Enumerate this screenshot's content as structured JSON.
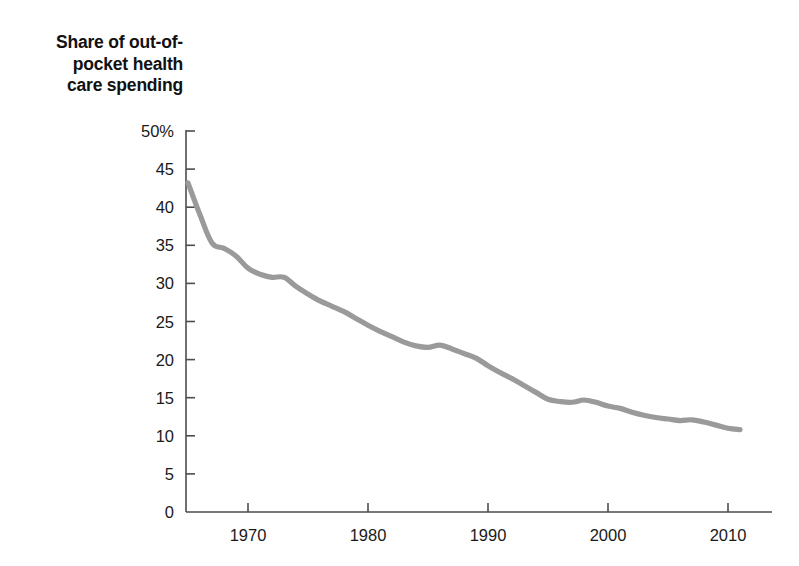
{
  "chart_data": {
    "type": "line",
    "title_lines": [
      "Share of out-of-",
      "pocket health",
      "care spending"
    ],
    "xlabel": "",
    "ylabel": "Share of out-of-pocket health care spending",
    "xlim": [
      1964.8,
      2012.5
    ],
    "ylim": [
      0,
      50
    ],
    "grid": false,
    "legend": "none",
    "line_color": "#9a9a9a",
    "axis_color": "#4d4d4d",
    "background_color": "#ffffff",
    "y_ticks": [
      0,
      5,
      10,
      15,
      20,
      25,
      30,
      35,
      40,
      45,
      50
    ],
    "y_tick_labels": [
      "0",
      "5",
      "10",
      "15",
      "20",
      "25",
      "30",
      "35",
      "40",
      "45",
      "50%"
    ],
    "x_ticks": [
      1970,
      1980,
      1990,
      2000,
      2010
    ],
    "x_tick_labels": [
      "1970",
      "1980",
      "1990",
      "2000",
      "2010"
    ],
    "series": [
      {
        "name": "Share of out-of-pocket health care spending",
        "units": "percent",
        "x": [
          1965,
          1966,
          1967,
          1968,
          1969,
          1970,
          1971,
          1972,
          1973,
          1974,
          1975,
          1976,
          1977,
          1978,
          1979,
          1980,
          1981,
          1982,
          1983,
          1984,
          1985,
          1986,
          1987,
          1988,
          1989,
          1990,
          1991,
          1992,
          1993,
          1994,
          1995,
          1996,
          1997,
          1998,
          1999,
          2000,
          2001,
          2002,
          2003,
          2004,
          2005,
          2006,
          2007,
          2008,
          2009,
          2010,
          2011
        ],
        "values": [
          43.2,
          39.0,
          35.3,
          34.6,
          33.6,
          32.0,
          31.2,
          30.8,
          30.8,
          29.6,
          28.6,
          27.7,
          27.0,
          26.3,
          25.4,
          24.5,
          23.7,
          23.0,
          22.3,
          21.8,
          21.6,
          21.9,
          21.4,
          20.8,
          20.2,
          19.2,
          18.3,
          17.5,
          16.6,
          15.7,
          14.8,
          14.5,
          14.4,
          14.7,
          14.4,
          13.9,
          13.6,
          13.1,
          12.7,
          12.4,
          12.2,
          12.0,
          12.1,
          11.8,
          11.4,
          11.0,
          10.8
        ]
      }
    ]
  }
}
